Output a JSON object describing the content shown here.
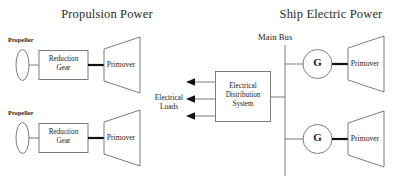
{
  "diagram": {
    "titles": {
      "left": "Propulsion Power",
      "right": "Ship Electric Power"
    },
    "labels": {
      "main_bus": "Main Bus",
      "electrical_loads_line1": "Electrical",
      "electrical_loads_line2": "Loads"
    },
    "propulsion_trains": [
      {
        "propeller_label": "Propeller",
        "reduction_gear_line1": "Reduction",
        "reduction_gear_line2": "Gear",
        "primover_label": "Primover"
      },
      {
        "propeller_label": "Propeller",
        "reduction_gear_line1": "Reduction",
        "reduction_gear_line2": "Gear",
        "primover_label": "Primover"
      }
    ],
    "distribution_box": {
      "line1": "Electrical",
      "line2": "Distribution",
      "line3": "System"
    },
    "generator_sets": [
      {
        "generator_letter": "G",
        "primover_label": "Primover"
      },
      {
        "generator_letter": "G",
        "primover_label": "Primover"
      }
    ],
    "colors": {
      "stroke": "#6e6e6e",
      "shaft": "#111111",
      "text": "#1a1a1a",
      "background": "#ffffff"
    }
  }
}
